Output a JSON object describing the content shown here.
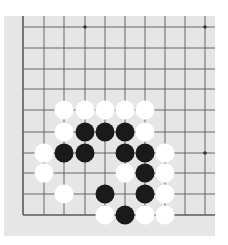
{
  "board": {
    "description": "Go board corner (bottom-left), 10x10 visible intersections",
    "background_color": "#e6e6e6",
    "line_color": "#5a5a5a",
    "columns_x": [
      23,
      44,
      64,
      85,
      105,
      125,
      145,
      165,
      185,
      205
    ],
    "rows_y": [
      27,
      48,
      69,
      89,
      110,
      132,
      153,
      173,
      194,
      215
    ],
    "edges": [
      "left",
      "bottom"
    ],
    "star_points": [
      [
        3,
        0
      ],
      [
        9,
        0
      ],
      [
        9,
        6
      ]
    ],
    "stone_radius": 9.5
  },
  "stones": [
    {
      "color": "white",
      "col": 2,
      "row": 4
    },
    {
      "color": "white",
      "col": 3,
      "row": 4
    },
    {
      "color": "white",
      "col": 4,
      "row": 4
    },
    {
      "color": "white",
      "col": 5,
      "row": 4
    },
    {
      "color": "white",
      "col": 6,
      "row": 4
    },
    {
      "color": "white",
      "col": 2,
      "row": 5
    },
    {
      "color": "black",
      "col": 3,
      "row": 5
    },
    {
      "color": "black",
      "col": 4,
      "row": 5
    },
    {
      "color": "black",
      "col": 5,
      "row": 5
    },
    {
      "color": "white",
      "col": 6,
      "row": 5
    },
    {
      "color": "white",
      "col": 1,
      "row": 6
    },
    {
      "color": "black",
      "col": 2,
      "row": 6
    },
    {
      "color": "black",
      "col": 3,
      "row": 6
    },
    {
      "color": "black",
      "col": 5,
      "row": 6
    },
    {
      "color": "black",
      "col": 6,
      "row": 6
    },
    {
      "color": "white",
      "col": 7,
      "row": 6
    },
    {
      "color": "white",
      "col": 1,
      "row": 7
    },
    {
      "color": "white",
      "col": 5,
      "row": 7
    },
    {
      "color": "black",
      "col": 6,
      "row": 7
    },
    {
      "color": "white",
      "col": 7,
      "row": 7
    },
    {
      "color": "white",
      "col": 2,
      "row": 8
    },
    {
      "color": "black",
      "col": 4,
      "row": 8
    },
    {
      "color": "black",
      "col": 6,
      "row": 8
    },
    {
      "color": "white",
      "col": 7,
      "row": 8
    },
    {
      "color": "white",
      "col": 4,
      "row": 9
    },
    {
      "color": "black",
      "col": 5,
      "row": 9
    },
    {
      "color": "white",
      "col": 6,
      "row": 9
    },
    {
      "color": "white",
      "col": 7,
      "row": 9
    }
  ]
}
